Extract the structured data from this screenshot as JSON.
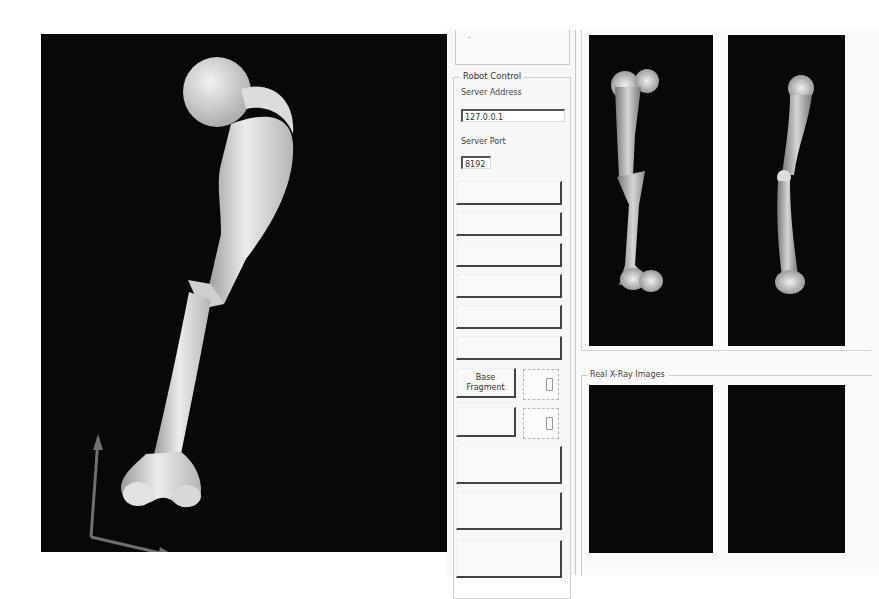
{
  "main_view": {
    "content": "3d-femur-model-fractured",
    "background": "#080808",
    "bone_color": "#e8e8e8",
    "axis_colors": {
      "x": "#6b6b6b",
      "y": "#6b6b6b"
    }
  },
  "control_panel": {
    "top_box_marker": "·",
    "robot_control": {
      "title": "Robot Control",
      "server_address_label": "Server Address",
      "server_address_value": "127.0.0.1",
      "server_port_label": "Server Port",
      "server_port_value": "8192"
    },
    "buttons": [
      {
        "label": ""
      },
      {
        "label": ""
      },
      {
        "label": ""
      },
      {
        "label": ""
      },
      {
        "label": ""
      },
      {
        "label": ""
      }
    ],
    "base_fragment_button": {
      "label_line1": "Base",
      "label_line2": "Fragment"
    },
    "second_fragment_button": {
      "label": ""
    },
    "lower_buttons": [
      {
        "label": ""
      },
      {
        "label": ""
      },
      {
        "label": ""
      }
    ]
  },
  "right_pane": {
    "virtual_xray": {
      "views": [
        "ap-view",
        "lateral-view"
      ]
    },
    "real_xray": {
      "title": "Real X-Ray Images",
      "views": [
        "ap-view-empty",
        "lateral-view-empty"
      ]
    }
  }
}
